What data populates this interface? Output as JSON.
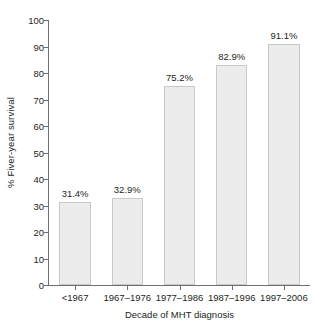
{
  "chart_data": {
    "type": "bar",
    "title": "",
    "subtitle": "",
    "xlabel": "Decade of MHT diagnosis",
    "ylabel": "% Fiver-year survival",
    "categories": [
      "<1967",
      "1967–1976",
      "1977–1986",
      "1987–1996",
      "1997–2006"
    ],
    "values": [
      31.4,
      32.9,
      75.2,
      82.9,
      91.1
    ],
    "data_labels": [
      "31.4%",
      "32.9%",
      "75.2%",
      "82.9%",
      "91.1%"
    ],
    "ylim": [
      0,
      100
    ],
    "y_ticks": [
      0,
      10,
      20,
      30,
      40,
      50,
      60,
      70,
      80,
      90,
      100
    ],
    "y_tick_labels": [
      "0",
      "10",
      "20",
      "30",
      "40",
      "50",
      "60",
      "70",
      "80",
      "90",
      "100"
    ],
    "grid": false,
    "legend": null,
    "legend_position": "none",
    "colors": {
      "bar_fill": "#ececec",
      "bar_border": "#c8c9ca",
      "axis": "#6d6e70",
      "text": "#231f20",
      "background": "#ffffff"
    }
  }
}
